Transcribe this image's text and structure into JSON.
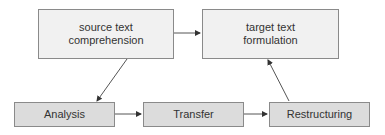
{
  "diagram": {
    "nodes": [
      {
        "id": "source",
        "label": "source text comprehension",
        "line1": "source text",
        "line2": "comprehension"
      },
      {
        "id": "target",
        "label": "target text formulation",
        "line1": "target text",
        "line2": "formulation"
      },
      {
        "id": "analysis",
        "label": "Analysis"
      },
      {
        "id": "transfer",
        "label": "Transfer"
      },
      {
        "id": "restructuring",
        "label": "Restructuring"
      }
    ],
    "edges": [
      {
        "from": "source",
        "to": "target"
      },
      {
        "from": "source",
        "to": "analysis"
      },
      {
        "from": "analysis",
        "to": "transfer"
      },
      {
        "from": "transfer",
        "to": "restructuring"
      },
      {
        "from": "restructuring",
        "to": "target"
      }
    ],
    "colors": {
      "top_fill": "#f1f1f1",
      "bottom_fill": "#dcdcdc",
      "border": "#8a8a8a",
      "line": "#555555",
      "text": "#333333"
    }
  }
}
